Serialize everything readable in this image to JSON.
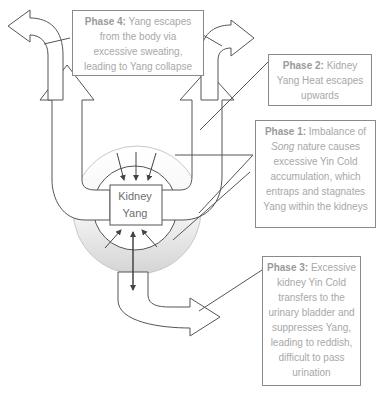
{
  "center": {
    "line1": "Kidney",
    "line2": "Yang"
  },
  "phases": [
    {
      "id": "phase1",
      "title": "Phase 1:",
      "text_before": " Imbalance of ",
      "italic": "Song",
      "text_after": " nature causes excessive Yin Cold accumulation, which entraps and stagnates Yang within the kidneys"
    },
    {
      "id": "phase2",
      "title": "Phase 2:",
      "text": " Kidney Yang Heat escapes upwards"
    },
    {
      "id": "phase3",
      "title": "Phase 3:",
      "text": " Excessive kidney Yin Cold transfers to the urinary bladder and suppresses Yang, leading to reddish, difficult to pass urination"
    },
    {
      "id": "phase4",
      "title": "Phase 4:",
      "text": " Yang escapes from the body via excessive sweating, leading to Yang collapse"
    }
  ],
  "colors": {
    "line": "#555555",
    "box_border": "#8a8a8a",
    "text": "#a8a8a8",
    "shading": "#d9d9d9"
  }
}
